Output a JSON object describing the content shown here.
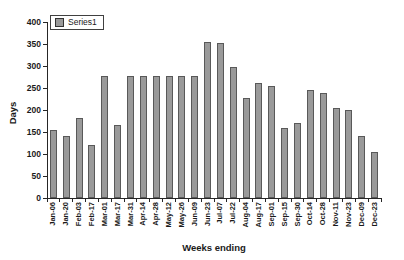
{
  "chart_data": {
    "type": "bar",
    "title": "",
    "xlabel": "Weeks ending",
    "ylabel": "Days",
    "ylim": [
      0,
      400
    ],
    "yticks": [
      0,
      50,
      100,
      150,
      200,
      250,
      300,
      350,
      400
    ],
    "grid": false,
    "legend_position": "top-left",
    "categories": [
      "Jan-06",
      "Jan-20",
      "Feb-03",
      "Feb-17",
      "Mar-01",
      "Mar-17",
      "Mar-31",
      "Apr-14",
      "Apr-28",
      "May-12",
      "May-26",
      "Jun-09",
      "Jun-23",
      "Jul-07",
      "Jul-22",
      "Aug-04",
      "Aug-17",
      "Sep-01",
      "Sep-15",
      "Sep-30",
      "Oct-14",
      "Oct-28",
      "Nov-11",
      "Nov-23",
      "Dec-09",
      "Dec-23"
    ],
    "series": [
      {
        "name": "Series1",
        "values": [
          155,
          140,
          182,
          120,
          278,
          167,
          278,
          278,
          278,
          278,
          278,
          278,
          355,
          352,
          297,
          228,
          262,
          254,
          160,
          170,
          245,
          238,
          205,
          200,
          140,
          105
        ]
      }
    ],
    "colors": {
      "bar_fill": "#9a9a9a",
      "bar_border": "#595959",
      "axis": "#262626",
      "text": "#1a1a1a",
      "background": "#ffffff"
    }
  }
}
